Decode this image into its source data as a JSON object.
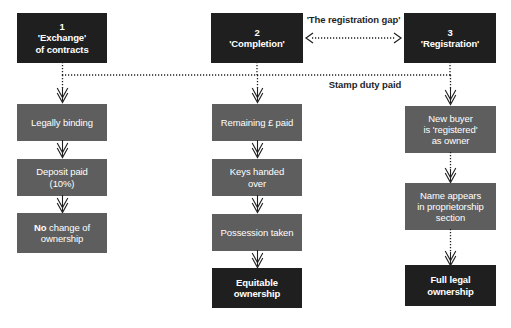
{
  "diagram": {
    "colors": {
      "stage_box": "#1f1f1f",
      "step_box": "#5e5e5e",
      "outcome_box": "#1f1f1f",
      "text": "#ffffff",
      "label_text": "#1f1f1f",
      "background": "#ffffff"
    },
    "stages": [
      {
        "number": "1",
        "line1": "'Exchange'",
        "line2": "of contracts"
      },
      {
        "number": "2",
        "line1": "'Completion'",
        "line2": ""
      },
      {
        "number": "3",
        "line1": "'Registration'",
        "line2": ""
      }
    ],
    "annotations": {
      "registration_gap": "'The registration gap'",
      "stamp_duty": "Stamp duty paid"
    },
    "columns": {
      "exchange": {
        "steps": [
          {
            "line1": "Legally binding",
            "line2": ""
          },
          {
            "line1": "Deposit paid",
            "line2": "(10%)"
          }
        ],
        "outcome": {
          "bold_lead": "No",
          "rest": " change of",
          "line2": "ownership"
        }
      },
      "completion": {
        "steps": [
          {
            "line1": "Remaining £ paid",
            "line2": ""
          },
          {
            "line1": "Keys handed",
            "line2": "over"
          },
          {
            "line1": "Possession taken",
            "line2": ""
          }
        ],
        "outcome": {
          "line1": "Equitable",
          "line2": "ownership"
        }
      },
      "registration": {
        "steps": [
          {
            "line1": "New buyer",
            "line2": "is 'registered'",
            "line3": "as owner"
          },
          {
            "line1": "Name appears",
            "line2": "in proprietorship",
            "line3": "section"
          }
        ],
        "outcome": {
          "line1": "Full legal",
          "line2": "ownership"
        }
      }
    }
  }
}
